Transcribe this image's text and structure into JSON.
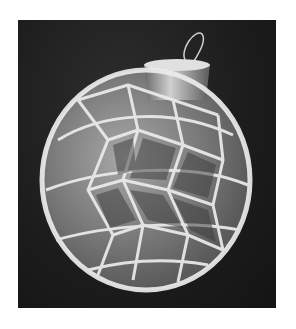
{
  "image": {
    "description": "Grayscale photo of a white crocheted lace cover on a round glass Christmas ornament with a silver cap and wire hanger, on a dark fabric background",
    "colors": {
      "background": "#1c1c1c",
      "lace": "#e8e8e8",
      "ornament_glass": "#8a8a8a",
      "cap": "#b0b0b0",
      "page_margin": "#ffffff"
    }
  }
}
